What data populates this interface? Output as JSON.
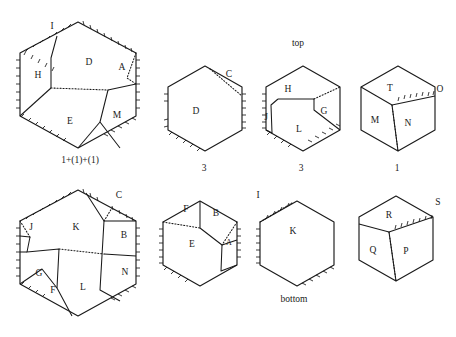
{
  "figure": {
    "title_top": "top",
    "title_bottom": "bottom",
    "background": "#ffffff",
    "ink": "#1a1a1a"
  },
  "shapes": [
    {
      "id": "top-left-hexagon",
      "row": "top",
      "position": 1,
      "caption": "1+(1)+(1)",
      "center": [
        78,
        85
      ],
      "radius": 62,
      "region_labels": [
        {
          "label": "I",
          "x": 52,
          "y": 27
        },
        {
          "label": "H",
          "x": 38,
          "y": 76
        },
        {
          "label": "D",
          "x": 89,
          "y": 63
        },
        {
          "label": "A",
          "x": 122,
          "y": 68
        },
        {
          "label": "E",
          "x": 70,
          "y": 122
        },
        {
          "label": "M",
          "x": 117,
          "y": 116
        }
      ]
    },
    {
      "id": "top-second-hexagon",
      "row": "top",
      "position": 2,
      "caption": "3",
      "center": [
        205,
        108
      ],
      "radius": 43,
      "region_labels": [
        {
          "label": "C",
          "x": 229,
          "y": 75
        },
        {
          "label": "D",
          "x": 196,
          "y": 112
        }
      ]
    },
    {
      "id": "top-third-hexagon",
      "row": "top",
      "position": 3,
      "caption": "3",
      "center": [
        303,
        108
      ],
      "radius": 43,
      "region_labels": [
        {
          "label": "H",
          "x": 288,
          "y": 90
        },
        {
          "label": "J",
          "x": 266,
          "y": 118
        },
        {
          "label": "G",
          "x": 324,
          "y": 112
        },
        {
          "label": "L",
          "x": 299,
          "y": 130
        }
      ]
    },
    {
      "id": "top-fourth-hexagon",
      "row": "top",
      "position": 4,
      "caption": "1",
      "center": [
        398,
        108
      ],
      "radius": 43,
      "region_labels": [
        {
          "label": "T",
          "x": 390,
          "y": 89
        },
        {
          "label": "O",
          "x": 437,
          "y": 90
        },
        {
          "label": "M",
          "x": 375,
          "y": 121
        },
        {
          "label": "N",
          "x": 408,
          "y": 124
        }
      ]
    },
    {
      "id": "bottom-left-hexagon",
      "row": "bottom",
      "position": 1,
      "caption": "",
      "center": [
        78,
        252
      ],
      "radius": 62,
      "region_labels": [
        {
          "label": "C",
          "x": 117,
          "y": 196
        },
        {
          "label": "J",
          "x": 32,
          "y": 228
        },
        {
          "label": "K",
          "x": 76,
          "y": 228
        },
        {
          "label": "B",
          "x": 124,
          "y": 236
        },
        {
          "label": "G",
          "x": 39,
          "y": 274
        },
        {
          "label": "F",
          "x": 53,
          "y": 291
        },
        {
          "label": "L",
          "x": 83,
          "y": 288
        },
        {
          "label": "N",
          "x": 125,
          "y": 273
        }
      ]
    },
    {
      "id": "bottom-second-hexagon",
      "row": "bottom",
      "position": 2,
      "caption": "",
      "center": [
        200,
        243
      ],
      "radius": 43,
      "region_labels": [
        {
          "label": "F",
          "x": 186,
          "y": 210
        },
        {
          "label": "B",
          "x": 216,
          "y": 214
        },
        {
          "label": "E",
          "x": 192,
          "y": 245
        },
        {
          "label": "A",
          "x": 228,
          "y": 243
        }
      ]
    },
    {
      "id": "bottom-third-hexagon",
      "row": "bottom",
      "position": 3,
      "caption": "bottom",
      "center": [
        297,
        243
      ],
      "radius": 43,
      "region_labels": [
        {
          "label": "I",
          "x": 258,
          "y": 196
        },
        {
          "label": "K",
          "x": 293,
          "y": 232
        }
      ]
    },
    {
      "id": "bottom-fourth-hexagon",
      "row": "bottom",
      "position": 4,
      "caption": "",
      "center": [
        396,
        238
      ],
      "radius": 43,
      "region_labels": [
        {
          "label": "R",
          "x": 389,
          "y": 216
        },
        {
          "label": "S",
          "x": 436,
          "y": 203
        },
        {
          "label": "Q",
          "x": 373,
          "y": 251
        },
        {
          "label": "P",
          "x": 406,
          "y": 252
        }
      ]
    }
  ],
  "captions": [
    {
      "name": "caption-top-label",
      "text": "top",
      "x": 298,
      "y": 46
    },
    {
      "name": "caption-bottom-label",
      "text": "bottom",
      "x": 294,
      "y": 302
    },
    {
      "name": "caption-hex1",
      "text": "1+(1)+(1)",
      "x": 80,
      "y": 163
    },
    {
      "name": "caption-hex2",
      "text": "3",
      "x": 204,
      "y": 171
    },
    {
      "name": "caption-hex3",
      "text": "3",
      "x": 301,
      "y": 171
    },
    {
      "name": "caption-hex4",
      "text": "1",
      "x": 397,
      "y": 171
    }
  ]
}
